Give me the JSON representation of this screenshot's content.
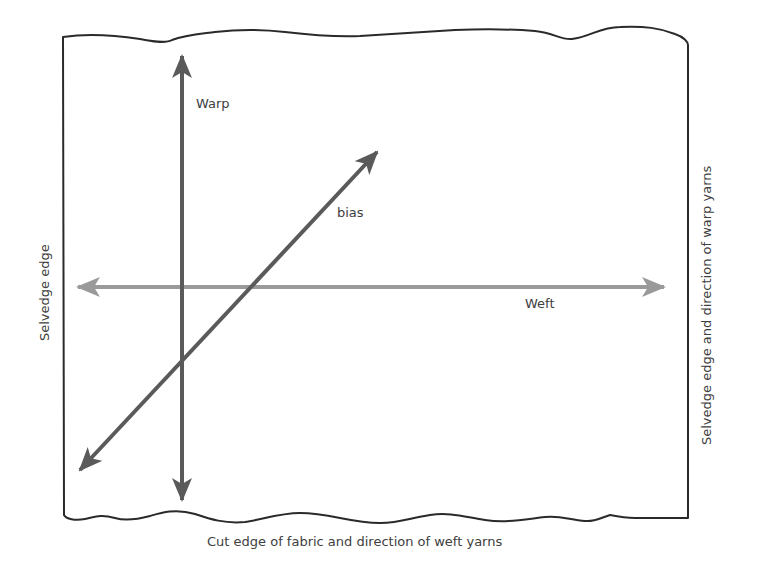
{
  "diagram": {
    "arrows": {
      "warp": {
        "label": "Warp",
        "color": "#5a5a5a"
      },
      "weft": {
        "label": "Weft",
        "color": "#9a9a9a"
      },
      "bias": {
        "label": "bias",
        "color": "#5a5a5a"
      }
    },
    "edges": {
      "left": "Selvedge edge",
      "right": "Selvedge edge and direction of warp yarns",
      "bottom": "Cut edge of fabric and direction of weft yarns"
    },
    "colors": {
      "outline": "#2a2a2a",
      "text": "#404040",
      "background": "#ffffff"
    }
  }
}
